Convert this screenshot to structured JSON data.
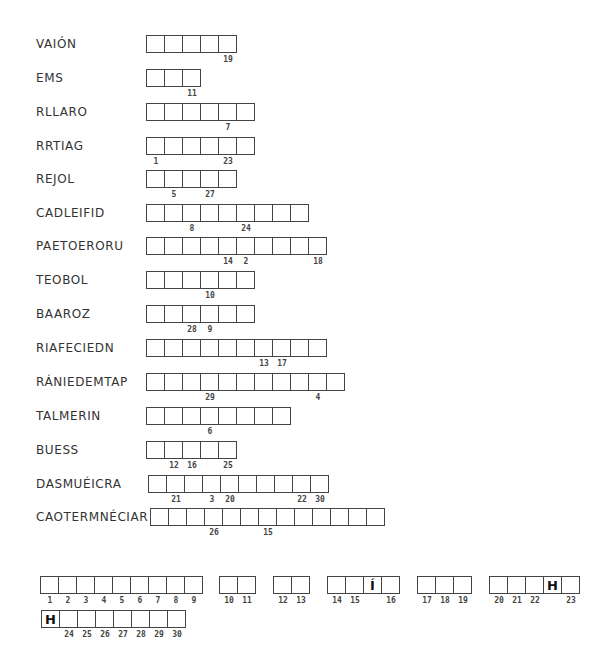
{
  "clues": [
    {
      "word": "VAIÓN",
      "length": 5,
      "numbers": {
        "4": "19"
      }
    },
    {
      "word": "EMS",
      "length": 3,
      "numbers": {
        "2": "11"
      }
    },
    {
      "word": "RLLARO",
      "length": 6,
      "numbers": {
        "4": "7"
      }
    },
    {
      "word": "RRTIAG",
      "length": 6,
      "numbers": {
        "0": "1",
        "4": "23"
      }
    },
    {
      "word": "REJOL",
      "length": 5,
      "numbers": {
        "1": "5",
        "3": "27"
      }
    },
    {
      "word": "CADLEIFID",
      "length": 9,
      "numbers": {
        "2": "8",
        "5": "24"
      }
    },
    {
      "word": "PAETOERORU",
      "length": 10,
      "numbers": {
        "4": "14",
        "5": "2",
        "9": "18"
      }
    },
    {
      "word": "TEOBOL",
      "length": 6,
      "numbers": {
        "3": "10"
      }
    },
    {
      "word": "BAAROZ",
      "length": 6,
      "numbers": {
        "2": "28",
        "3": "9"
      }
    },
    {
      "word": "RIAFECIEDN",
      "length": 10,
      "numbers": {
        "6": "13",
        "7": "17"
      }
    },
    {
      "word": "RÁNIEDEMTAP",
      "length": 11,
      "numbers": {
        "3": "29",
        "9": "4"
      }
    },
    {
      "word": "TALMERIN",
      "length": 8,
      "numbers": {
        "3": "6"
      }
    },
    {
      "word": "BUESS",
      "length": 5,
      "numbers": {
        "1": "12",
        "2": "16",
        "4": "25"
      }
    },
    {
      "word": "DASMUÉICRA",
      "length": 10,
      "numbers": {
        "1": "21",
        "3": "3",
        "4": "20",
        "8": "22",
        "9": "30"
      }
    },
    {
      "word": "CAOTERMNÉCIAR",
      "length": 13,
      "numbers": {
        "3": "26",
        "6": "15"
      }
    }
  ],
  "answer": {
    "row1": [
      {
        "cells": [
          {
            "n": "1"
          },
          {
            "n": "2"
          },
          {
            "n": "3"
          },
          {
            "n": "4"
          },
          {
            "n": "5"
          },
          {
            "n": "6"
          },
          {
            "n": "7"
          },
          {
            "n": "8"
          },
          {
            "n": "9"
          }
        ]
      },
      {
        "cells": [
          {
            "n": "10"
          },
          {
            "n": "11"
          }
        ]
      },
      {
        "cells": [
          {
            "n": "12"
          },
          {
            "n": "13"
          }
        ]
      },
      {
        "cells": [
          {
            "n": "14"
          },
          {
            "n": "15"
          },
          {
            "letter": "Í"
          },
          {
            "n": "16"
          }
        ]
      },
      {
        "cells": [
          {
            "n": "17"
          },
          {
            "n": "18"
          },
          {
            "n": "19"
          }
        ]
      },
      {
        "cells": [
          {
            "n": "20"
          },
          {
            "n": "21"
          },
          {
            "n": "22"
          },
          {
            "letter": "H"
          },
          {
            "n": "23"
          }
        ]
      }
    ],
    "row2": [
      {
        "cells": [
          {
            "letter": "H"
          },
          {
            "n": "24"
          },
          {
            "n": "25"
          },
          {
            "n": "26"
          },
          {
            "n": "27"
          },
          {
            "n": "28"
          },
          {
            "n": "29"
          },
          {
            "n": "30"
          }
        ]
      }
    ]
  }
}
